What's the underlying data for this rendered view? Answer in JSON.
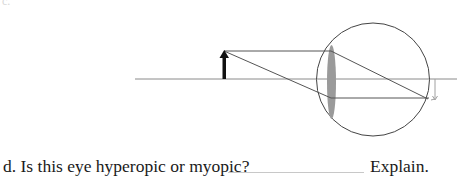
{
  "fragment_label": "c.",
  "question": {
    "text": "d. Is this eye hyperopic or myopic?",
    "answer_value": "",
    "explain_label": "Explain."
  },
  "diagram": {
    "colors": {
      "object_arrow": "#111111",
      "rays": "#555555",
      "axis": "#8a8a8a",
      "lens": "#9a9a9a",
      "eyeball": "#444444",
      "image_arrow": "#a0a0a0"
    },
    "elements": [
      "optical-axis",
      "object-arrow",
      "converging-lens",
      "eyeball",
      "light-rays",
      "image-arrow"
    ]
  }
}
